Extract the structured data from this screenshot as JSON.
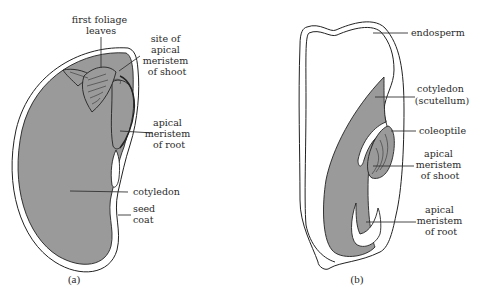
{
  "figure": {
    "panel_a": {
      "caption": "(a)",
      "labels": {
        "first_foliage_leaves": [
          "first foliage",
          "leaves"
        ],
        "site_apical_meristem_shoot": [
          "site of",
          "apical",
          "meristem",
          "of shoot"
        ],
        "apical_meristem_root": [
          "apical",
          "meristem",
          "of root"
        ],
        "cotyledon": [
          "cotyledon"
        ],
        "seed_coat": [
          "seed",
          "coat"
        ]
      }
    },
    "panel_b": {
      "caption": "(b)",
      "labels": {
        "endosperm": [
          "endosperm"
        ],
        "cotyledon_scutellum": [
          "cotyledon",
          "(scutellum)"
        ],
        "coleoptile": [
          "coleoptile"
        ],
        "apical_meristem_shoot": [
          "apical",
          "meristem",
          "of shoot"
        ],
        "apical_meristem_root": [
          "apical",
          "meristem",
          "of root"
        ]
      }
    },
    "colors": {
      "tissue_fill": "#9a9a9a",
      "outline": "#222222",
      "background": "#ffffff"
    }
  }
}
